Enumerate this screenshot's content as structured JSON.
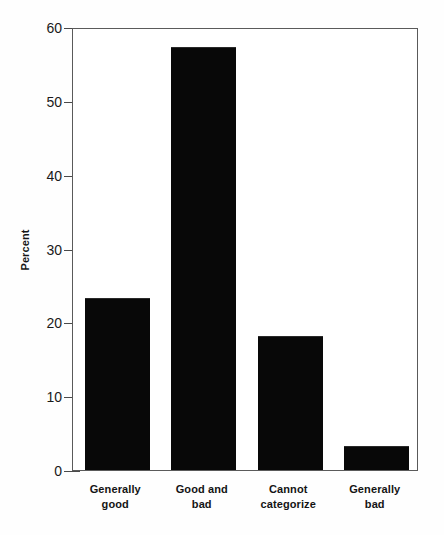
{
  "chart_data": {
    "type": "bar",
    "title": "",
    "subtitle": "",
    "xlabel": "",
    "ylabel": "Percent",
    "categories": [
      "Generally good",
      "Good and bad",
      "Cannot categorize",
      "Generally bad"
    ],
    "category_lines": [
      [
        "Generally",
        "good"
      ],
      [
        "Good and",
        "bad"
      ],
      [
        "Cannot",
        "categorize"
      ],
      [
        "Generally",
        "bad"
      ]
    ],
    "values": [
      23.3,
      57.3,
      18.1,
      3.3
    ],
    "ylim": [
      0,
      60
    ],
    "yticks": [
      0,
      10,
      20,
      30,
      40,
      50,
      60
    ],
    "ytick_labels": [
      "0",
      "10",
      "20",
      "30",
      "40",
      "50",
      "60"
    ],
    "grid": false,
    "legend": null,
    "bar_color": "#080808",
    "frame_color": "#5a5a5a",
    "background": "#ffffff"
  }
}
